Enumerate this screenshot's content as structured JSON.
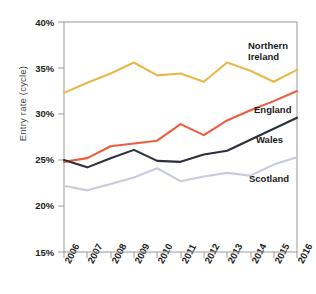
{
  "chart_data": {
    "type": "line",
    "title": "",
    "xlabel": "",
    "ylabel": "Entry rate (cycle)",
    "categories": [
      "2006",
      "2007",
      "2008",
      "2009",
      "2010",
      "2011",
      "2012",
      "2013",
      "2014",
      "2015",
      "2016"
    ],
    "x": [
      2006,
      2007,
      2008,
      2009,
      2010,
      2011,
      2012,
      2013,
      2014,
      2015,
      2016
    ],
    "ylim": [
      15,
      40
    ],
    "ytick_labels": [
      "15%",
      "20%",
      "25%",
      "30%",
      "35%",
      "40%"
    ],
    "ytick_values": [
      15,
      20,
      25,
      30,
      35,
      40
    ],
    "grid": false,
    "legend_position": "inline-right",
    "series": [
      {
        "name": "Northern Ireland",
        "label_lines": [
          "Northern",
          "Ireland"
        ],
        "color": "#E8B84B",
        "values": [
          32.3,
          33.4,
          34.4,
          35.6,
          34.2,
          34.4,
          33.5,
          35.6,
          34.7,
          33.5,
          34.8
        ]
      },
      {
        "name": "England",
        "label_lines": [
          "England"
        ],
        "color": "#EE5C3C",
        "values": [
          24.8,
          25.2,
          26.5,
          26.8,
          27.1,
          28.9,
          27.7,
          29.3,
          30.4,
          31.4,
          32.5
        ]
      },
      {
        "name": "Wales",
        "label_lines": [
          "Wales"
        ],
        "color": "#2B2F3E",
        "values": [
          25.0,
          24.2,
          25.2,
          26.1,
          24.9,
          24.8,
          25.6,
          26.0,
          27.2,
          28.4,
          29.6
        ]
      },
      {
        "name": "Scotland",
        "label_lines": [
          "Scotland"
        ],
        "color": "#C8CAE0",
        "values": [
          22.2,
          21.7,
          22.4,
          23.1,
          24.1,
          22.7,
          23.2,
          23.6,
          23.3,
          24.5,
          25.3
        ]
      }
    ]
  },
  "axis": {
    "y_label": "Entry rate (cycle)",
    "y_ticks": [
      "40%",
      "35%",
      "30%",
      "25%",
      "20%",
      "15%"
    ],
    "x_ticks": [
      "2006",
      "2007",
      "2008",
      "2009",
      "2010",
      "2011",
      "2012",
      "2013",
      "2014",
      "2015",
      "2016"
    ]
  },
  "labels": {
    "northern_ireland_line1": "Northern",
    "northern_ireland_line2": "Ireland",
    "england": "England",
    "wales": "Wales",
    "scotland": "Scotland"
  },
  "colors": {
    "northern_ireland": "#E8B84B",
    "england": "#EE5C3C",
    "wales": "#2B2F3E",
    "scotland": "#C8CAE0",
    "axis": "#808080",
    "text": "#222222"
  }
}
